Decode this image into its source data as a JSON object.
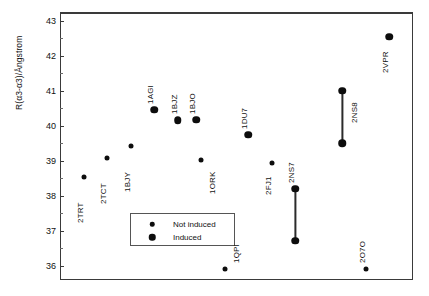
{
  "chart_data": {
    "type": "scatter",
    "title": "",
    "subtitle": "",
    "xlabel": "",
    "ylabel": "R(α3-α3)/Ångstrom",
    "ylim": [
      35.6,
      43.25
    ],
    "yticks": [
      36,
      37,
      38,
      39,
      40,
      41,
      42,
      43
    ],
    "ytick_labels": [
      "36",
      "37",
      "38",
      "39",
      "40",
      "41",
      "42",
      "43"
    ],
    "xlim": [
      0,
      15
    ],
    "xticks": [],
    "xtick_labels": [],
    "grid": false,
    "legend_position": "lower-left-inside",
    "legend": [
      {
        "label": "Not induced",
        "marker": "small-filled-circle"
      },
      {
        "label": "Induced",
        "marker": "large-filled-circle"
      }
    ],
    "series": [
      {
        "name": "Not induced",
        "marker_size": "small",
        "points": [
          {
            "label": "2TRT",
            "x": 1,
            "y": 38.55
          },
          {
            "label": "2TCT",
            "x": 2,
            "y": 39.08
          },
          {
            "label": "1BJY",
            "x": 3,
            "y": 39.43
          },
          {
            "label": "1ORK",
            "x": 6,
            "y": 39.02
          },
          {
            "label": "1QPI",
            "x": 7,
            "y": 35.92
          },
          {
            "label": "2FJ1",
            "x": 9,
            "y": 38.95
          },
          {
            "label": "2O7O",
            "x": 13,
            "y": 35.9
          }
        ]
      },
      {
        "name": "Induced",
        "marker_size": "large",
        "points": [
          {
            "label": "1AGI",
            "x": 4,
            "y": 40.46
          },
          {
            "label": "1BJZ",
            "x": 5,
            "y": 40.16
          },
          {
            "label": "1BJO",
            "x": 5.8,
            "y": 40.18
          },
          {
            "label": "1DU7",
            "x": 8,
            "y": 39.75
          },
          {
            "label": "2VPR",
            "x": 14,
            "y": 42.54
          }
        ]
      }
    ],
    "ranges": [
      {
        "label": "2NS7",
        "x": 10,
        "y_low": 36.72,
        "y_high": 38.2,
        "connected": true
      },
      {
        "label": "2NS8",
        "x": 12,
        "y_low": 39.5,
        "y_high": 41.0,
        "connected": true
      }
    ],
    "annotations": [
      {
        "text": "2TRT"
      },
      {
        "text": "2TCT"
      },
      {
        "text": "1BJY"
      },
      {
        "text": "1AGI"
      },
      {
        "text": "1BJZ"
      },
      {
        "text": "1BJO"
      },
      {
        "text": "1ORK"
      },
      {
        "text": "1QPI"
      },
      {
        "text": "1DU7"
      },
      {
        "text": "2FJ1"
      },
      {
        "text": "2NS7"
      },
      {
        "text": "2NS8"
      },
      {
        "text": "2O7O"
      },
      {
        "text": "2VPR"
      }
    ],
    "colors": {
      "marker": "#0d0d0d",
      "frame": "#3a3a3a",
      "text": "#111111",
      "background": "#ffffff"
    }
  }
}
